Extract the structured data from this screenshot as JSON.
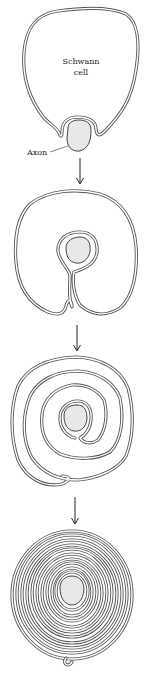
{
  "diagram": {
    "stages": [
      {
        "id": 1,
        "description": "Schwann cell contacts axon",
        "labels": {
          "cell": "Schwann cell",
          "cell_line1": "Schwann",
          "cell_line2": "cell",
          "axon": "Axon"
        }
      },
      {
        "id": 2,
        "description": "Schwann cell envelops axon"
      },
      {
        "id": 3,
        "description": "Schwann cell membrane begins wrapping in spiral"
      },
      {
        "id": 4,
        "description": "Many layers of myelin sheath around axon"
      }
    ],
    "arrows": [
      "arrow-1-to-2",
      "arrow-2-to-3",
      "arrow-3-to-4"
    ],
    "colors": {
      "membrane": "#555555",
      "axon_fill": "#e8e8e8",
      "background": "#ffffff"
    }
  }
}
